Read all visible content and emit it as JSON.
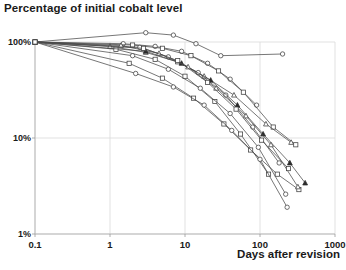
{
  "chart_data": {
    "type": "line",
    "title": "Percentage of initial cobalt level",
    "xlabel": "Days after revision",
    "ylabel": "",
    "xscale": "log",
    "yscale": "log",
    "xlim": [
      0.1,
      1000
    ],
    "ylim": [
      1,
      100
    ],
    "grid": true,
    "legend": "none",
    "xticks": [
      0.1,
      1,
      10,
      100,
      1000
    ],
    "xtick_labels": [
      "0.1",
      "1",
      "10",
      "100",
      "1000"
    ],
    "yticks": [
      100,
      10,
      1
    ],
    "ytick_labels": [
      "100%",
      "10%",
      "1%"
    ],
    "units": {
      "x": "days",
      "y": "percent of initial cobalt level"
    },
    "series": [
      {
        "name": "patient-1",
        "marker": "circle",
        "x": [
          0.1,
          3,
          7,
          14,
          30,
          200
        ],
        "y": [
          100,
          125,
          118,
          96,
          72,
          75
        ]
      },
      {
        "name": "patient-2",
        "marker": "circle",
        "x": [
          0.1,
          1.5,
          4,
          9,
          20,
          40,
          90
        ],
        "y": [
          100,
          96,
          90,
          80,
          60,
          41,
          22
        ]
      },
      {
        "name": "patient-3",
        "marker": "square",
        "x": [
          0.1,
          2,
          5,
          12,
          28,
          60,
          150,
          300
        ],
        "y": [
          100,
          93,
          86,
          72,
          50,
          30,
          13,
          8.5
        ]
      },
      {
        "name": "patient-4",
        "marker": "triangle",
        "x": [
          0.1,
          1,
          3,
          8,
          18,
          45,
          120,
          260
        ],
        "y": [
          100,
          90,
          78,
          62,
          44,
          28,
          14,
          9
        ]
      },
      {
        "name": "patient-5",
        "marker": "circle",
        "x": [
          0.1,
          2.5,
          6,
          15,
          35,
          80,
          180
        ],
        "y": [
          100,
          88,
          70,
          48,
          28,
          13,
          5.5
        ]
      },
      {
        "name": "patient-6",
        "marker": "square",
        "x": [
          0.1,
          1.2,
          4,
          10,
          25,
          55,
          130
        ],
        "y": [
          100,
          84,
          66,
          44,
          24,
          11,
          4.2
        ]
      },
      {
        "name": "patient-7",
        "marker": "triangle-filled",
        "x": [
          0.1,
          3,
          9,
          22,
          50,
          110,
          250,
          400
        ],
        "y": [
          100,
          80,
          60,
          40,
          22,
          11,
          5.5,
          3.4
        ]
      },
      {
        "name": "patient-8",
        "marker": "circle",
        "x": [
          0.1,
          2,
          6,
          16,
          40,
          95,
          220
        ],
        "y": [
          100,
          72,
          52,
          33,
          18,
          8,
          2.6
        ]
      },
      {
        "name": "patient-9",
        "marker": "square",
        "x": [
          0.1,
          1.8,
          5,
          13,
          33,
          75,
          170,
          330
        ],
        "y": [
          100,
          60,
          42,
          26,
          14,
          7.5,
          4.2,
          2.9
        ]
      },
      {
        "name": "patient-10",
        "marker": "circle",
        "x": [
          0.1,
          2.2,
          7,
          18,
          42,
          100,
          230
        ],
        "y": [
          100,
          47,
          34,
          22,
          12,
          6,
          1.9
        ]
      },
      {
        "name": "patient-11",
        "marker": "triangle",
        "x": [
          0.1,
          1.4,
          4.5,
          11,
          26,
          65,
          140,
          320
        ],
        "y": [
          100,
          92,
          76,
          55,
          33,
          17,
          8.5,
          3.1
        ]
      },
      {
        "name": "patient-12",
        "marker": "square",
        "x": [
          0.1,
          2.8,
          8,
          20,
          48,
          105,
          240
        ],
        "y": [
          100,
          86,
          64,
          38,
          20,
          9.5,
          4.8
        ]
      }
    ]
  },
  "axes": {
    "y_labels": [
      "100%",
      "10%",
      "1%"
    ],
    "x_labels": [
      "0.1",
      "1",
      "10",
      "100",
      "1000"
    ]
  }
}
